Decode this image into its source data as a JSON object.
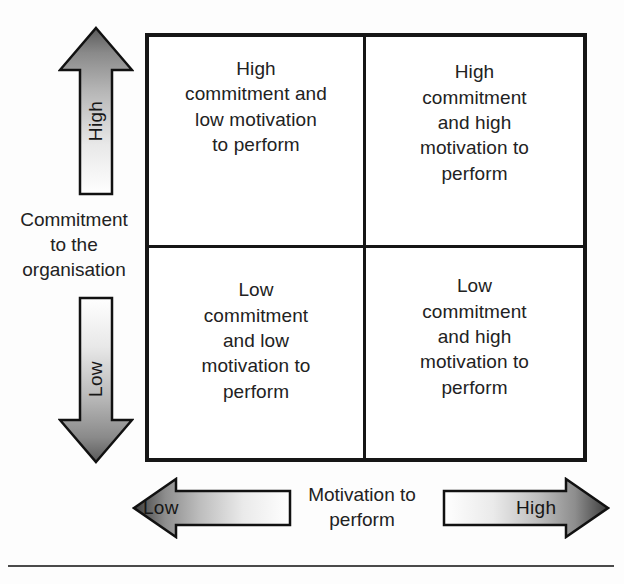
{
  "figure": {
    "type": "2x2-matrix-diagram",
    "background_color": "#fdfdfd",
    "border_color": "#161616"
  },
  "matrix": {
    "quadrants": [
      {
        "position": "top-left",
        "commitment": "High",
        "motivation": "Low",
        "text": "High\ncommitment and\nlow motivation\nto perform"
      },
      {
        "position": "top-right",
        "commitment": "High",
        "motivation": "High",
        "text": "High\ncommitment\nand high\nmotivation to\nperform"
      },
      {
        "position": "bottom-left",
        "commitment": "Low",
        "motivation": "Low",
        "text": "Low\ncommitment\nand low\nmotivation to\nperform"
      },
      {
        "position": "bottom-right",
        "commitment": "Low",
        "motivation": "High",
        "text": "Low\ncommitment\nand high\nmotivation to\nperform"
      }
    ]
  },
  "axes": {
    "y": {
      "label": "Commitment\nto the\norganisation",
      "high_label": "High",
      "low_label": "Low"
    },
    "x": {
      "label": "Motivation  to\nperform",
      "low_label": "Low",
      "high_label": "High"
    }
  },
  "arrows": {
    "up": {
      "name": "high-commitment-arrow",
      "direction": "up",
      "gradient": "dark-at-tip"
    },
    "down": {
      "name": "low-commitment-arrow",
      "direction": "down",
      "gradient": "dark-at-tip"
    },
    "left": {
      "name": "low-motivation-arrow",
      "direction": "left",
      "gradient": "dark-at-tip"
    },
    "right": {
      "name": "high-motivation-arrow",
      "direction": "right",
      "gradient": "dark-at-tip"
    }
  }
}
